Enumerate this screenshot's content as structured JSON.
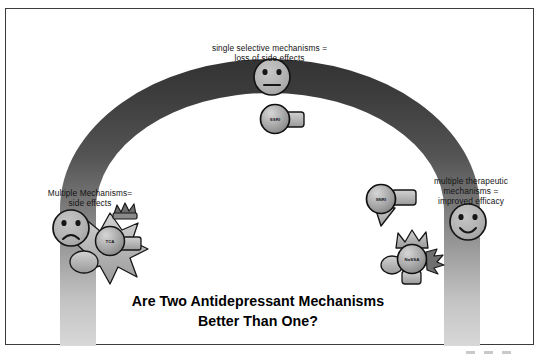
{
  "slide": {
    "title_line1": "Are Two Antidepressant Mechanisms",
    "title_line2": "Better Than One?",
    "title_text": "Are Two Antidepressant Mechanisms\nBetter Than One?"
  },
  "annotations": {
    "top": {
      "name": "single-selective-mechanisms-label",
      "line1": "single selective mechanisms =",
      "line2": "loss of side effects",
      "text": "single selective mechanisms =\nloss of side effects"
    },
    "left": {
      "name": "multiple-mechanisms-side-effects-label",
      "line1": "Multiple Mechanisms=",
      "line2": "side effects",
      "text": "Multiple Mechanisms=\nside effects"
    },
    "right": {
      "name": "multiple-therapeutic-mechanisms-label",
      "line1": "multiple therapeutic",
      "line2": "mechanisms =",
      "line3": "improved efficacy",
      "text": "multiple therapeutic\nmechanisms =\nimproved efficacy"
    }
  },
  "drugs": [
    {
      "id": "tca",
      "label": "TCA",
      "position": "arch-lower-left",
      "mechanisms": "many"
    },
    {
      "id": "ssri",
      "label": "SSRI",
      "position": "arch-apex",
      "mechanisms": "one"
    },
    {
      "id": "snri",
      "label": "SNRI",
      "position": "arch-mid-right",
      "mechanisms": "two"
    },
    {
      "id": "nassa",
      "label": "NaSSA",
      "position": "arch-lower-right",
      "mechanisms": "many"
    }
  ],
  "faces": [
    {
      "id": "neutral",
      "expression": "neutral",
      "position": "top-center"
    },
    {
      "id": "sad",
      "expression": "sad",
      "position": "left"
    },
    {
      "id": "happy",
      "expression": "happy",
      "position": "right"
    }
  ],
  "colors": {
    "arch_apex": "#3a3a3a",
    "arch_base": "#cccccc",
    "face_fill": "#b4b4b4",
    "pill_fill": "#a8a8a8",
    "outline": "#1b1b1b",
    "frame": "#3c3c3c",
    "background": "#ffffff",
    "title_text": "#000000"
  }
}
